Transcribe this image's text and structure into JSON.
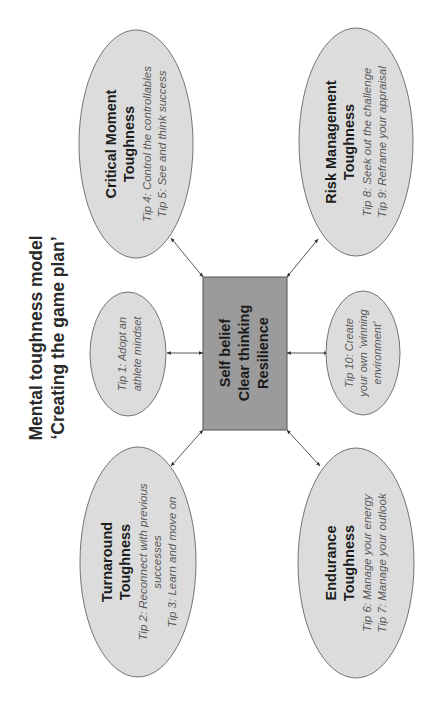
{
  "title": {
    "line1": "Mental toughness model",
    "line2": "‘Creating the game plan’"
  },
  "orientation": "rotated-90-ccw",
  "colors": {
    "ellipse_fill": "#dcdcdc",
    "ellipse_stroke": "#666666",
    "center_fill": "#9b9b9b",
    "center_stroke": "#555555",
    "heading_text": "#1c1c1c",
    "tip_text": "#5a5a5a"
  },
  "center": {
    "lines": [
      "Self belief",
      "Clear thinking",
      "Resilience"
    ]
  },
  "nodes": {
    "critical_moment": {
      "heading": [
        "Critical Moment",
        "Toughness"
      ],
      "tips": [
        "Tip 4: Control the controllables",
        "Tip 5: See and think success"
      ]
    },
    "risk_management": {
      "heading": [
        "Risk Management",
        "Toughness"
      ],
      "tips": [
        "Tip 8: Seek out the challenge",
        "Tip 9: Reframe your appraisal"
      ]
    },
    "turnaround": {
      "heading": [
        "Turnaround",
        "Toughness"
      ],
      "tips": [
        "Tip 2: Reconnect with previous",
        "successes",
        "Tip 3: Learn and move on"
      ]
    },
    "endurance": {
      "heading": [
        "Endurance",
        "Toughness"
      ],
      "tips": [
        "Tip 6: Manage your energy",
        "Tip 7: Manage your outlook"
      ]
    },
    "tip1": {
      "tips": [
        "Tip 1: Adopt an",
        "athlete mindset"
      ]
    },
    "tip10": {
      "tips": [
        "Tip 10: Create",
        "your own ‘winning",
        "environment’"
      ]
    }
  }
}
